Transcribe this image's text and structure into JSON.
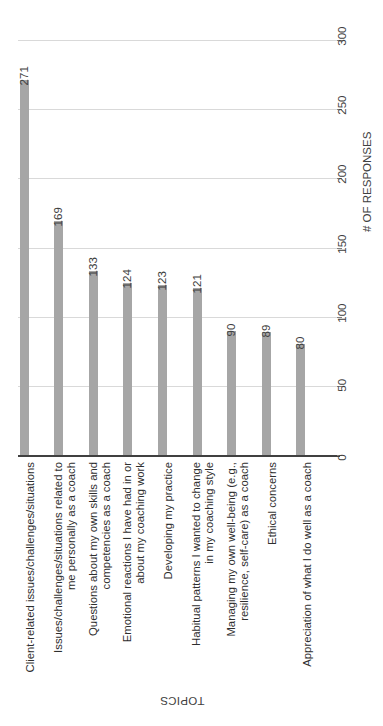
{
  "chart_data": {
    "type": "bar",
    "title": "",
    "orientation": "rotated-90",
    "xlabel": "TOPICS",
    "ylabel": "# OF RESPONSES",
    "ylim": [
      0,
      300
    ],
    "yticks": [
      0,
      50,
      100,
      150,
      200,
      250,
      300
    ],
    "grid": true,
    "legend": false,
    "bar_color": "#a6a6a6",
    "categories": [
      "Client-related issues/challenges/situations",
      "Issues/challenges/situations related to\nme personally as a coach",
      "Questions about my own skills and\ncompetencies as a coach",
      "Emotional reactions I have had in or\nabout my coaching work",
      "Developing my practice",
      "Habitual patterns I wanted to change\nin my coaching style",
      "Managing my own well-being (e.g.,\nresilience, self-care) as a coach",
      "Ethical concerns",
      "Appreciation of what I do well as a coach"
    ],
    "values": [
      271,
      169,
      133,
      124,
      123,
      121,
      90,
      89,
      80
    ],
    "value_labels": [
      "271",
      "169",
      "133",
      "124",
      "123",
      "121",
      "90",
      "89",
      "80"
    ],
    "tick_labels": [
      "0",
      "50",
      "100",
      "150",
      "200",
      "250",
      "300"
    ]
  }
}
